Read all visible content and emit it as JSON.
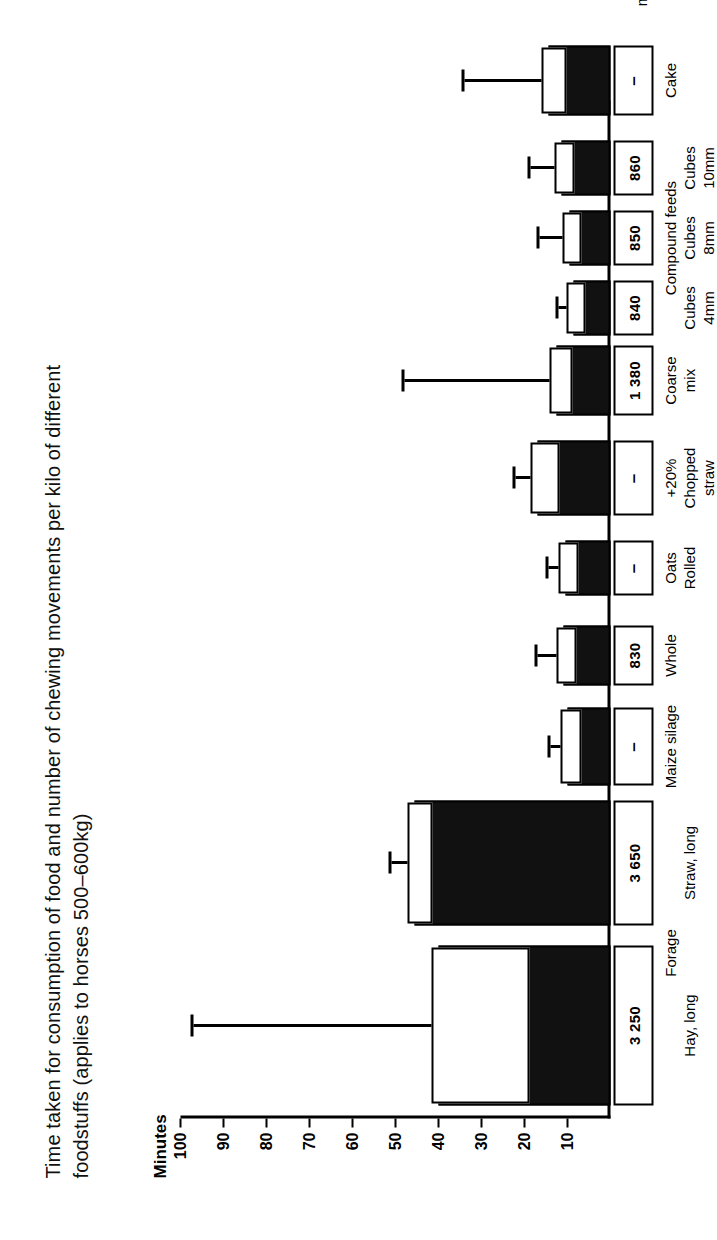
{
  "figure": {
    "title": "Time taken for consumption of food and number of chewing movements per kilo of different foodstuffs (applies to horses 500–600kg)",
    "y_axis_label": "Minutes",
    "chewing_row_title": "Chewing\nmovements",
    "chewing_row_title_line1": "Chewing",
    "chewing_row_title_line2": "movements"
  },
  "axis": {
    "ticks": [
      "100",
      "90",
      "80",
      "70",
      "60",
      "50",
      "40",
      "30",
      "20",
      "10"
    ]
  },
  "groups": {
    "forage": "Forage",
    "compound": "Compound feeds"
  },
  "chart_data": {
    "type": "bar",
    "title": "Time taken for consumption of food and number of chewing movements per kilo of different foodstuffs (applies to horses 500–600kg)",
    "xlabel": "",
    "ylabel": "Minutes",
    "ylim": [
      0,
      100
    ],
    "grid": false,
    "legend": false,
    "orientation": "vertical",
    "note": "Black bars = minutes per kilo; the white window inside each bar spans the observed range, and the thin whisker with a cap marks the maximum. The boxed numbers beneath the baseline are chewing movements per kilo ('–' = not measured).",
    "categories": [
      "Hay, long",
      "Straw, long",
      "Maize silage",
      "Whole",
      "Oats Rolled",
      "+20% Chopped straw",
      "Coarse mix",
      "Cubes 4mm",
      "Cubes 8mm",
      "Cubes 10mm",
      "Cake"
    ],
    "category_lines": [
      [
        "Hay, long"
      ],
      [
        "Straw, long"
      ],
      [
        "Maize silage"
      ],
      [
        "Whole"
      ],
      [
        "Oats",
        "Rolled"
      ],
      [
        "+20%",
        "Chopped",
        "straw"
      ],
      [
        "Coarse",
        "mix"
      ],
      [
        "Cubes",
        "4mm"
      ],
      [
        "Cubes",
        "8mm"
      ],
      [
        "Cubes",
        "10mm"
      ],
      [
        "Cake"
      ]
    ],
    "group_spans": [
      {
        "label": "Forage",
        "from": 0,
        "to": 1
      },
      {
        "label": "Compound feeds",
        "from": 7,
        "to": 9
      }
    ],
    "series": [
      {
        "name": "Minutes per kilo (bar height)",
        "values": [
          40,
          45.5,
          10,
          11,
          10.5,
          17,
          12.5,
          8.5,
          9.5,
          11.5,
          14.5
        ]
      },
      {
        "name": "Range window low (minutes)",
        "values": [
          20,
          42.5,
          8,
          9,
          8.5,
          13,
          10,
          7,
          8,
          9.5,
          11.5
        ]
      },
      {
        "name": "Range window high (minutes)",
        "values": [
          40,
          45.5,
          10,
          11,
          10.5,
          17,
          12.5,
          8.5,
          9.5,
          11.5,
          14.5
        ]
      },
      {
        "name": "Maximum whisker (minutes)",
        "values": [
          97,
          51,
          14,
          17,
          14.5,
          22,
          48,
          12,
          16.5,
          18.5,
          34
        ]
      }
    ],
    "chewing_movements": [
      "3 250",
      "3 650",
      "–",
      "830",
      "–",
      "–",
      "1 380",
      "840",
      "850",
      "860",
      "–"
    ]
  }
}
